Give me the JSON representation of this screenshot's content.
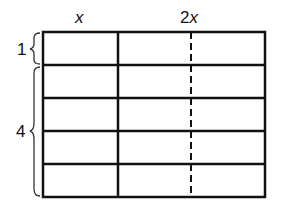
{
  "diagram": {
    "column_labels": [
      {
        "text": "x",
        "italic": true
      },
      {
        "prefix": "2",
        "var": "x"
      }
    ],
    "row_labels": [
      {
        "text": "1",
        "spans_rows": 1
      },
      {
        "text": "4",
        "spans_rows": 4
      }
    ],
    "grid": {
      "rows": 5,
      "columns": 2,
      "column_widths_ratio": [
        1,
        2
      ],
      "dashed_divider_in_column": 2,
      "line_color": "#111111"
    }
  }
}
